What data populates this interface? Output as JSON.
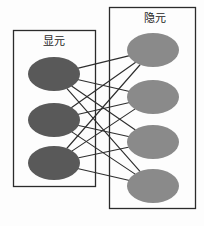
{
  "diagram": {
    "type": "bipartite-network",
    "title": "",
    "background_color": "#fdfdfd",
    "edge_color": "#2e2e2e",
    "box_border_color": "#2b2b2b",
    "layers": [
      {
        "id": "visible",
        "label": "显元",
        "node_count": 3,
        "node_color": "#595959",
        "box": {
          "x": 13,
          "y": 30,
          "width": 82,
          "height": 156
        },
        "label_pos": {
          "x": 54,
          "y": 42
        },
        "nodes": [
          {
            "index": 0,
            "cx": 54,
            "cy": 74,
            "rx": 26,
            "ry": 17
          },
          {
            "index": 1,
            "cx": 54,
            "cy": 120,
            "rx": 26,
            "ry": 17
          },
          {
            "index": 2,
            "cx": 54,
            "cy": 163,
            "rx": 26,
            "ry": 17
          }
        ]
      },
      {
        "id": "hidden",
        "label": "隐元",
        "node_count": 4,
        "node_color": "#8a8a8a",
        "box": {
          "x": 109,
          "y": 7,
          "width": 86,
          "height": 201
        },
        "label_pos": {
          "x": 155,
          "y": 19
        },
        "nodes": [
          {
            "index": 0,
            "cx": 153,
            "cy": 50,
            "rx": 26,
            "ry": 17
          },
          {
            "index": 1,
            "cx": 153,
            "cy": 97,
            "rx": 26,
            "ry": 17
          },
          {
            "index": 2,
            "cx": 153,
            "cy": 142,
            "rx": 26,
            "ry": 17
          },
          {
            "index": 3,
            "cx": 153,
            "cy": 186,
            "rx": 26,
            "ry": 17
          }
        ]
      }
    ],
    "edges": [
      {
        "from": 0,
        "to": 0
      },
      {
        "from": 0,
        "to": 1
      },
      {
        "from": 0,
        "to": 2
      },
      {
        "from": 0,
        "to": 3
      },
      {
        "from": 1,
        "to": 0
      },
      {
        "from": 1,
        "to": 1
      },
      {
        "from": 1,
        "to": 2
      },
      {
        "from": 1,
        "to": 3
      },
      {
        "from": 2,
        "to": 0
      },
      {
        "from": 2,
        "to": 1
      },
      {
        "from": 2,
        "to": 2
      },
      {
        "from": 2,
        "to": 3
      }
    ],
    "edge_count": 12
  }
}
